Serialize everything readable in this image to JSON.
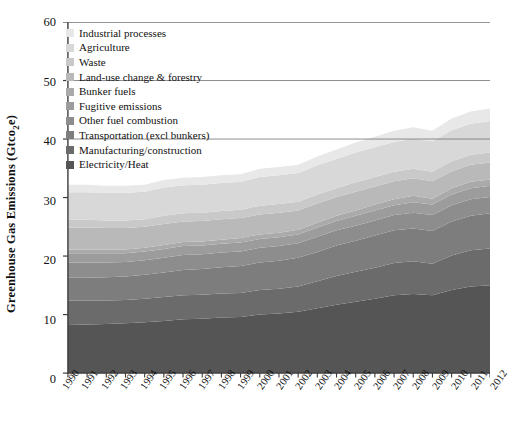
{
  "chart_data": {
    "type": "area",
    "stacked": true,
    "title": "",
    "xlabel": "",
    "ylabel": "Greenhouse Gas Emissions (Gtco2e)",
    "ylabel_parts": {
      "pre": "Greenhouse Gas Emissions (Gtco",
      "sub": "2",
      "post": "e)"
    },
    "ylim": [
      0,
      60
    ],
    "yticks": [
      0,
      10,
      20,
      30,
      40,
      50,
      60
    ],
    "grid": false,
    "legend_position": "upper-left-inside",
    "categories": [
      "1990",
      "1991",
      "1992",
      "1993",
      "1994",
      "1995",
      "1996",
      "1997",
      "1998",
      "1999",
      "2000",
      "2001",
      "2002",
      "2003",
      "2004",
      "2005",
      "2006",
      "2007",
      "2008",
      "2009",
      "2010",
      "2011",
      "2012"
    ],
    "series": [
      {
        "name": "Electricity/Heat",
        "color": "#555555",
        "values": [
          8.2,
          8.3,
          8.4,
          8.5,
          8.7,
          8.9,
          9.2,
          9.3,
          9.5,
          9.6,
          10.0,
          10.2,
          10.5,
          11.1,
          11.7,
          12.2,
          12.7,
          13.3,
          13.5,
          13.3,
          14.2,
          14.8,
          15.0
        ]
      },
      {
        "name": "Manufacturing/construction",
        "color": "#6b6b6b",
        "values": [
          4.2,
          4.1,
          4.0,
          4.0,
          4.0,
          4.1,
          4.1,
          4.1,
          4.1,
          4.1,
          4.2,
          4.2,
          4.3,
          4.6,
          4.9,
          5.1,
          5.3,
          5.5,
          5.6,
          5.4,
          5.9,
          6.2,
          6.3
        ]
      },
      {
        "name": "Transportation (excl bunkers)",
        "color": "#7d7d7d",
        "values": [
          3.9,
          3.9,
          4.0,
          4.0,
          4.1,
          4.2,
          4.3,
          4.4,
          4.5,
          4.6,
          4.7,
          4.8,
          4.9,
          5.0,
          5.2,
          5.3,
          5.5,
          5.6,
          5.6,
          5.6,
          5.8,
          5.9,
          6.0
        ]
      },
      {
        "name": "Other fuel combustion",
        "color": "#8d8d8d",
        "values": [
          2.6,
          2.6,
          2.5,
          2.5,
          2.5,
          2.5,
          2.6,
          2.5,
          2.5,
          2.5,
          2.5,
          2.5,
          2.5,
          2.6,
          2.6,
          2.6,
          2.6,
          2.6,
          2.7,
          2.7,
          2.8,
          2.8,
          2.8
        ]
      },
      {
        "name": "Fugitive emissions",
        "color": "#9c9c9c",
        "values": [
          1.6,
          1.6,
          1.6,
          1.5,
          1.5,
          1.5,
          1.5,
          1.5,
          1.5,
          1.5,
          1.5,
          1.5,
          1.5,
          1.6,
          1.6,
          1.7,
          1.7,
          1.7,
          1.8,
          1.8,
          1.8,
          1.9,
          1.9
        ]
      },
      {
        "name": "Bunker fuels",
        "color": "#aaaaaa",
        "values": [
          0.6,
          0.6,
          0.6,
          0.6,
          0.6,
          0.7,
          0.7,
          0.7,
          0.7,
          0.8,
          0.8,
          0.8,
          0.8,
          0.8,
          0.9,
          0.9,
          1.0,
          1.0,
          1.1,
          1.0,
          1.1,
          1.1,
          1.1
        ]
      },
      {
        "name": "Land-use change & forestry",
        "color": "#b9b9b9",
        "values": [
          3.8,
          3.8,
          3.7,
          3.7,
          3.6,
          3.6,
          3.5,
          3.5,
          3.5,
          3.4,
          3.4,
          3.4,
          3.3,
          3.3,
          3.2,
          3.2,
          3.1,
          3.1,
          3.0,
          3.0,
          2.9,
          2.9,
          2.9
        ]
      },
      {
        "name": "Waste",
        "color": "#c9c9c9",
        "values": [
          1.3,
          1.3,
          1.3,
          1.3,
          1.3,
          1.4,
          1.4,
          1.4,
          1.4,
          1.4,
          1.5,
          1.5,
          1.5,
          1.5,
          1.5,
          1.6,
          1.6,
          1.6,
          1.6,
          1.6,
          1.7,
          1.7,
          1.7
        ]
      },
      {
        "name": "Agriculture",
        "color": "#d8d8d8",
        "values": [
          4.7,
          4.7,
          4.7,
          4.7,
          4.7,
          4.8,
          4.8,
          4.8,
          4.8,
          4.8,
          4.9,
          4.9,
          4.9,
          5.0,
          5.0,
          5.1,
          5.1,
          5.1,
          5.2,
          5.2,
          5.3,
          5.3,
          5.4
        ]
      },
      {
        "name": "Industrial processes",
        "color": "#e8e8e8",
        "values": [
          1.3,
          1.3,
          1.2,
          1.2,
          1.2,
          1.3,
          1.3,
          1.3,
          1.3,
          1.3,
          1.4,
          1.4,
          1.4,
          1.5,
          1.6,
          1.7,
          1.8,
          1.9,
          1.9,
          1.8,
          2.0,
          2.1,
          2.1
        ]
      }
    ],
    "legend_order": [
      "Industrial processes",
      "Agriculture",
      "Waste",
      "Land-use change & forestry",
      "Bunker fuels",
      "Fugitive emissions",
      "Other fuel combustion",
      "Transportation (excl bunkers)",
      "Manufacturing/construction",
      "Electricity/Heat"
    ],
    "axis_color": "#3a3a3a",
    "text_color": "#111111"
  }
}
